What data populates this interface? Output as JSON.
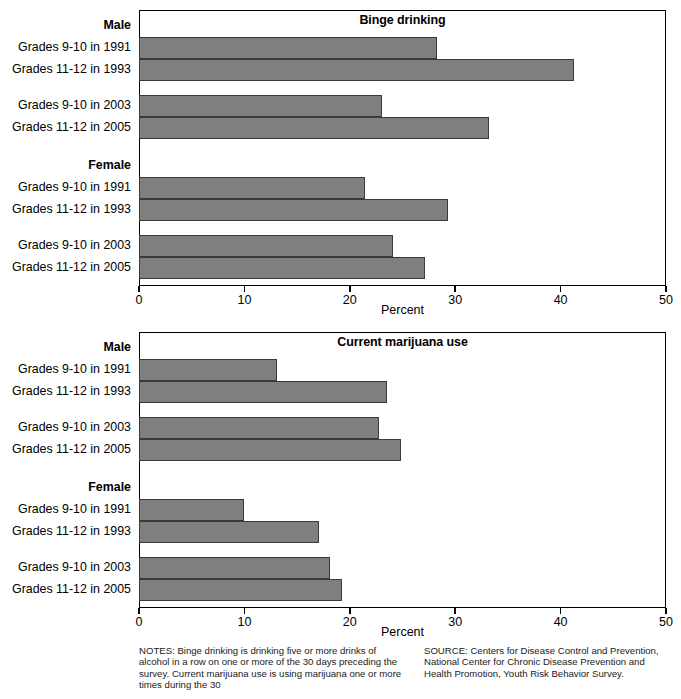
{
  "figure": {
    "axis_title": "Percent",
    "x_ticks": [
      0,
      10,
      20,
      30,
      40,
      50
    ],
    "group_heads": {
      "male": "Male",
      "female": "Female"
    },
    "categories": [
      "Grades 9-10 in 1991",
      "Grades 11-12 in 1993",
      "Grades 9-10 in 2003",
      "Grades 11-12 in 2005"
    ],
    "bar_color": "#7f7f7f",
    "bar_edge_color": "#3a3a3a"
  },
  "panels": [
    {
      "title": "Binge drinking"
    },
    {
      "title": "Current marijuana use"
    }
  ],
  "footer": {
    "notes": "NOTES: Binge drinking is drinking five or more drinks of alcohol in a row on one or more of the 30 days preceding the survey. Current marijuana use is using marijuana one or more times during the 30",
    "source": "SOURCE: Centers for Disease Control and Prevention, National Center for Chronic Disease Prevention and Health Promotion, Youth Risk Behavior Survey."
  },
  "chart_data": [
    {
      "type": "bar",
      "orientation": "horizontal",
      "title": "Binge drinking",
      "xlabel": "Percent",
      "ylabel": "",
      "xlim": [
        0,
        50
      ],
      "xticks": [
        0,
        10,
        20,
        30,
        40,
        50
      ],
      "grid": false,
      "legend": "none",
      "groups": [
        {
          "name": "Male",
          "categories": [
            "Grades 9-10 in 1991",
            "Grades 11-12 in 1993",
            "Grades 9-10 in 2003",
            "Grades 11-12 in 2005"
          ],
          "values": [
            28.3,
            41.3,
            23.1,
            33.2
          ]
        },
        {
          "name": "Female",
          "categories": [
            "Grades 9-10 in 1991",
            "Grades 11-12 in 1993",
            "Grades 9-10 in 2003",
            "Grades 11-12 in 2005"
          ],
          "values": [
            21.4,
            29.3,
            24.1,
            27.1
          ]
        }
      ]
    },
    {
      "type": "bar",
      "orientation": "horizontal",
      "title": "Current marijuana use",
      "xlabel": "Percent",
      "ylabel": "",
      "xlim": [
        0,
        50
      ],
      "xticks": [
        0,
        10,
        20,
        30,
        40,
        50
      ],
      "grid": false,
      "legend": "none",
      "groups": [
        {
          "name": "Male",
          "categories": [
            "Grades 9-10 in 1991",
            "Grades 11-12 in 1993",
            "Grades 9-10 in 2003",
            "Grades 11-12 in 2005"
          ],
          "values": [
            13.1,
            23.5,
            22.8,
            24.9
          ]
        },
        {
          "name": "Female",
          "categories": [
            "Grades 9-10 in 1991",
            "Grades 11-12 in 1993",
            "Grades 9-10 in 2003",
            "Grades 11-12 in 2005"
          ],
          "values": [
            10.0,
            17.1,
            18.1,
            19.3
          ]
        }
      ]
    }
  ]
}
